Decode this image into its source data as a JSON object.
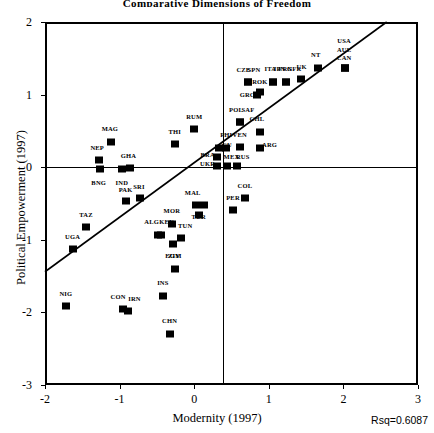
{
  "chart_data": {
    "type": "scatter",
    "title": "Comparative Dimensions of Freedom",
    "xlabel": "Modernity (1997)",
    "ylabel": "Political Empowerment (1997)",
    "xlim": [
      -2,
      3
    ],
    "ylim": [
      -3,
      2
    ],
    "xticks": [
      -2,
      -1,
      0,
      1,
      2,
      3
    ],
    "yticks": [
      -3,
      -2,
      -1,
      0,
      1,
      2
    ],
    "xticklabels": [
      "-2",
      "-1",
      "0",
      "1",
      "2",
      "3"
    ],
    "yticklabels": [
      "-3",
      "-2",
      "-1",
      "0",
      "1",
      "2"
    ],
    "grid": false,
    "legend": null,
    "annotations": [
      {
        "name": "rsq",
        "text": "Rsq=0.6087",
        "position": "bottom-right"
      }
    ],
    "reference_lines": [
      {
        "orientation": "vertical",
        "value": 0.39
      },
      {
        "orientation": "horizontal",
        "value": 0.0
      }
    ],
    "fit_line": {
      "type": "linear-regression",
      "x_start": -2.0,
      "y_start": -1.44,
      "x_end": 2.58,
      "y_end": 2.0
    },
    "points": [
      {
        "label": "NIG",
        "x": -1.72,
        "y": -1.91,
        "lx": -1.72,
        "ly": -1.74
      },
      {
        "label": "UGA",
        "x": -1.63,
        "y": -1.13,
        "lx": -1.63,
        "ly": -0.96
      },
      {
        "label": "TAZ",
        "x": -1.45,
        "y": -0.83,
        "lx": -1.45,
        "ly": -0.66
      },
      {
        "label": "NEP",
        "x": -1.28,
        "y": 0.1,
        "lx": -1.3,
        "ly": 0.27
      },
      {
        "label": "BNG",
        "x": -1.26,
        "y": -0.03,
        "lx": -1.28,
        "ly": -0.22
      },
      {
        "label": "MAG",
        "x": -1.12,
        "y": 0.35,
        "lx": -1.13,
        "ly": 0.52
      },
      {
        "label": "CON",
        "x": -0.95,
        "y": -1.96,
        "lx": -1.02,
        "ly": -1.79
      },
      {
        "label": "IRN",
        "x": -0.89,
        "y": -1.98,
        "lx": -0.8,
        "ly": -1.82
      },
      {
        "label": "IND",
        "x": -0.97,
        "y": -0.02,
        "lx": -0.97,
        "ly": -0.22
      },
      {
        "label": "GHA",
        "x": -0.86,
        "y": -0.01,
        "lx": -0.88,
        "ly": 0.16
      },
      {
        "label": "PAK",
        "x": -0.92,
        "y": -0.47,
        "lx": -0.92,
        "ly": -0.31
      },
      {
        "label": "SRI",
        "x": -0.73,
        "y": -0.43,
        "lx": -0.74,
        "ly": -0.27
      },
      {
        "label": "ALG",
        "x": -0.49,
        "y": -0.94,
        "lx": -0.57,
        "ly": -0.76
      },
      {
        "label": "KEN",
        "x": -0.45,
        "y": -0.94,
        "lx": -0.37,
        "ly": -0.76
      },
      {
        "label": "INS",
        "x": -0.42,
        "y": -1.78,
        "lx": -0.42,
        "ly": -1.6
      },
      {
        "label": "CHN",
        "x": -0.33,
        "y": -2.3,
        "lx": -0.33,
        "ly": -2.12
      },
      {
        "label": "MOR",
        "x": -0.3,
        "y": -0.78,
        "lx": -0.3,
        "ly": -0.6
      },
      {
        "label": "EGY",
        "x": -0.29,
        "y": -1.06,
        "lx": -0.29,
        "ly": -1.23
      },
      {
        "label": "ZIM",
        "x": -0.26,
        "y": -1.4,
        "lx": -0.26,
        "ly": -1.22
      },
      {
        "label": "TUN",
        "x": -0.18,
        "y": -0.97,
        "lx": -0.12,
        "ly": -0.81
      },
      {
        "label": "THI",
        "x": -0.26,
        "y": 0.32,
        "lx": -0.26,
        "ly": 0.49
      },
      {
        "label": "MAL",
        "x": 0.03,
        "y": -0.52,
        "lx": -0.02,
        "ly": -0.35
      },
      {
        "label": "MAL2",
        "x": 0.13,
        "y": -0.52,
        "lx": null,
        "ly": null
      },
      {
        "label": "TUR",
        "x": 0.06,
        "y": -0.66,
        "lx": 0.06,
        "ly": -0.69
      },
      {
        "label": "RUM",
        "x": 0.0,
        "y": 0.52,
        "lx": 0.0,
        "ly": 0.69
      },
      {
        "label": "BRA",
        "x": 0.3,
        "y": 0.14,
        "lx": 0.18,
        "ly": 0.17
      },
      {
        "label": "UKR",
        "x": 0.3,
        "y": 0.02,
        "lx": 0.18,
        "ly": 0.05
      },
      {
        "label": "CU",
        "x": 0.33,
        "y": 0.26,
        "lx": 0.44,
        "ly": 0.3
      },
      {
        "label": "PHI",
        "x": 0.43,
        "y": 0.27,
        "lx": 0.43,
        "ly": 0.44
      },
      {
        "label": "MEX",
        "x": 0.44,
        "y": 0.01,
        "lx": 0.5,
        "ly": 0.14
      },
      {
        "label": "RUS",
        "x": 0.57,
        "y": 0.01,
        "lx": 0.65,
        "ly": 0.14
      },
      {
        "label": "VEN",
        "x": 0.61,
        "y": 0.28,
        "lx": 0.61,
        "ly": 0.45
      },
      {
        "label": "POL",
        "x": 0.62,
        "y": 0.62,
        "lx": 0.56,
        "ly": 0.79
      },
      {
        "label": "SAF",
        "x": 0.62,
        "y": 0.62,
        "lx": 0.72,
        "ly": 0.79
      },
      {
        "label": "PER",
        "x": 0.52,
        "y": -0.59,
        "lx": 0.52,
        "ly": -0.42
      },
      {
        "label": "COL",
        "x": 0.68,
        "y": -0.43,
        "lx": 0.68,
        "ly": -0.26
      },
      {
        "label": "CHL",
        "x": 0.88,
        "y": 0.49,
        "lx": 0.84,
        "ly": 0.66
      },
      {
        "label": "ARG",
        "x": 0.88,
        "y": 0.27,
        "lx": 1.01,
        "ly": 0.3
      },
      {
        "label": "CZE",
        "x": 0.72,
        "y": 1.17,
        "lx": 0.66,
        "ly": 1.34
      },
      {
        "label": "SPN",
        "x": 0.72,
        "y": 1.17,
        "lx": 0.8,
        "ly": 1.34
      },
      {
        "label": "GRC",
        "x": 0.84,
        "y": 1.0,
        "lx": 0.71,
        "ly": 1.0
      },
      {
        "label": "ROK",
        "x": 0.88,
        "y": 1.03,
        "lx": 0.88,
        "ly": 1.17
      },
      {
        "label": "ITA",
        "x": 1.06,
        "y": 1.18,
        "lx": 1.02,
        "ly": 1.35
      },
      {
        "label": "JPN",
        "x": 1.06,
        "y": 1.18,
        "lx": 1.14,
        "ly": 1.35
      },
      {
        "label": "FRN",
        "x": 1.23,
        "y": 1.18,
        "lx": 1.22,
        "ly": 1.35
      },
      {
        "label": "GFR",
        "x": 1.23,
        "y": 1.18,
        "lx": 1.34,
        "ly": 1.35
      },
      {
        "label": "UK",
        "x": 1.43,
        "y": 1.21,
        "lx": 1.44,
        "ly": 1.38
      },
      {
        "label": "NT",
        "x": 1.66,
        "y": 1.36,
        "lx": 1.63,
        "ly": 1.55
      },
      {
        "label": "USA",
        "x": 2.02,
        "y": 1.36,
        "lx": 2.01,
        "ly": 1.74
      },
      {
        "label": "AUL",
        "x": 2.02,
        "y": 1.36,
        "lx": 2.01,
        "ly": 1.62
      },
      {
        "label": "CAN",
        "x": 2.02,
        "y": 1.36,
        "lx": 2.01,
        "ly": 1.5
      }
    ]
  }
}
